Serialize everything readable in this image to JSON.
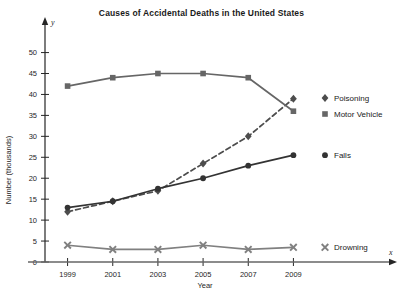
{
  "chart_data": {
    "type": "line",
    "title": "Causes of Accidental Deaths in the United States",
    "xlabel": "Year",
    "ylabel": "Number (thousands)",
    "x_axis_symbol": "x",
    "y_axis_symbol": "y",
    "categories": [
      1999,
      2001,
      2003,
      2005,
      2007,
      2009
    ],
    "xlim": [
      1998,
      2010
    ],
    "ylim": [
      0,
      53
    ],
    "yticks": [
      0,
      5,
      10,
      15,
      20,
      25,
      30,
      35,
      40,
      45,
      50
    ],
    "xticks": [
      "1999",
      "2001",
      "2003",
      "2005",
      "2007",
      "2009"
    ],
    "grid": false,
    "legend_position": "right",
    "series": [
      {
        "name": "Poisoning",
        "marker": "diamond",
        "line_style": "dashed",
        "color": "#4d4d4d",
        "values": [
          12,
          14.5,
          17,
          23.5,
          30,
          39
        ]
      },
      {
        "name": "Motor Vehicle",
        "marker": "square",
        "line_style": "solid",
        "color": "#666666",
        "values": [
          42,
          44,
          45,
          45,
          44,
          36
        ]
      },
      {
        "name": "Falls",
        "marker": "circle",
        "line_style": "solid",
        "color": "#333333",
        "values": [
          13,
          14.5,
          17.5,
          20,
          23,
          25.5
        ]
      },
      {
        "name": "Drowning",
        "marker": "x",
        "line_style": "solid",
        "color": "#808080",
        "values": [
          4,
          3,
          3,
          4,
          3,
          3.5
        ]
      }
    ]
  }
}
